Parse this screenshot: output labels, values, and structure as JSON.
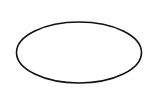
{
  "canvas": {
    "width": 160,
    "height": 109,
    "background": "#ffffff"
  },
  "shapes": [
    {
      "type": "ellipse",
      "cx": 79,
      "cy": 52.5,
      "rx": 62.5,
      "ry": 30.5,
      "stroke": "#111111",
      "stroke_width": 1.6,
      "fill": "none"
    }
  ]
}
